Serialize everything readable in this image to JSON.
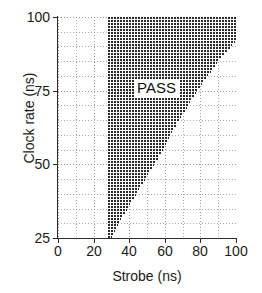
{
  "chart_data": {
    "type": "area",
    "title": "",
    "xlabel": "Strobe (ns)",
    "ylabel": "Clock rate (ns)",
    "xlim": [
      0,
      100
    ],
    "ylim": [
      25,
      100
    ],
    "xticks": [
      0,
      20,
      40,
      60,
      80,
      100
    ],
    "yticks": [
      25,
      50,
      75,
      100
    ],
    "xtick_labels": [
      "0",
      "20",
      "40",
      "60",
      "80",
      "100"
    ],
    "ytick_labels": [
      "25",
      "50",
      "75",
      "100"
    ],
    "grid": true,
    "grid_style": "dotted",
    "grid_x_step": 10,
    "grid_y_step": 5,
    "legend": "none",
    "annotations": [
      {
        "text": "PASS",
        "x": 50,
        "y": 75
      }
    ],
    "series": [
      {
        "name": "PASS region",
        "fill": "hatched",
        "fill_color": "#2a2a2a",
        "description": "Shmoo pass region bounded on the left by strobe = 28 ns and on the right by a diagonal boundary rising from strobe = 30 ns at clock rate 25 ns to strobe = 100 ns at clock rate 92 ns, flat at strobe = 100 ns above that.",
        "left_boundary": {
          "x_constant": 28
        },
        "right_boundary_points": [
          {
            "clock_rate": 25,
            "strobe_max": 30
          },
          {
            "clock_rate": 30,
            "strobe_max": 34
          },
          {
            "clock_rate": 35,
            "strobe_max": 39
          },
          {
            "clock_rate": 40,
            "strobe_max": 44
          },
          {
            "clock_rate": 45,
            "strobe_max": 49
          },
          {
            "clock_rate": 50,
            "strobe_max": 54
          },
          {
            "clock_rate": 55,
            "strobe_max": 59
          },
          {
            "clock_rate": 60,
            "strobe_max": 63
          },
          {
            "clock_rate": 65,
            "strobe_max": 68
          },
          {
            "clock_rate": 70,
            "strobe_max": 73
          },
          {
            "clock_rate": 75,
            "strobe_max": 78
          },
          {
            "clock_rate": 80,
            "strobe_max": 84
          },
          {
            "clock_rate": 85,
            "strobe_max": 90
          },
          {
            "clock_rate": 90,
            "strobe_max": 97
          },
          {
            "clock_rate": 92,
            "strobe_max": 100
          },
          {
            "clock_rate": 95,
            "strobe_max": 100
          },
          {
            "clock_rate": 100,
            "strobe_max": 100
          }
        ]
      }
    ]
  },
  "axes": {
    "ylabel": "Clock rate (ns)",
    "xlabel": "Strobe (ns)"
  },
  "annotation": {
    "pass_label": "PASS"
  },
  "colors": {
    "hatch": "#2a2a2a",
    "grid": "#9a9a9a",
    "axis": "#2b2b2b",
    "background": "#ffffff",
    "text": "#1a1a1a"
  }
}
